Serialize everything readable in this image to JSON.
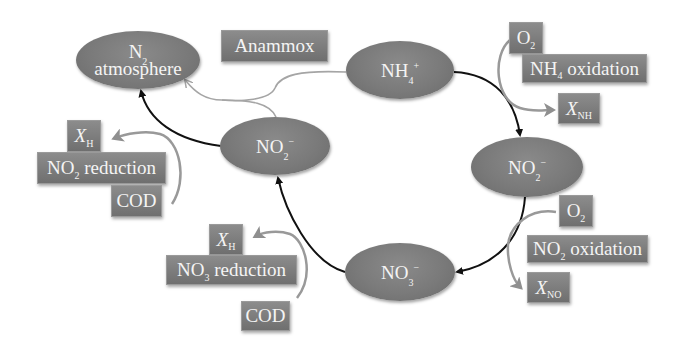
{
  "diagram": {
    "colors": {
      "node_fill": "#7a7a7a",
      "box_fill": "#7d7d7d",
      "text": "#f4f4f4",
      "main_arrow": "#111111",
      "side_arrow": "#9a9a9a"
    },
    "nodes": {
      "n2": {
        "line1_main": "N",
        "line1_sub": "2",
        "line2": "atmosphere"
      },
      "nh4": {
        "main": "NH",
        "sub": "4",
        "sup": "+"
      },
      "no2_right": {
        "main": "NO",
        "sub": "2",
        "sup": "−"
      },
      "no3": {
        "main": "NO",
        "sub": "3",
        "sup": "−"
      },
      "no2_left": {
        "main": "NO",
        "sub": "2",
        "sup": "−"
      }
    },
    "labels": {
      "anammox": "Anammox",
      "nh4_oxidation": {
        "pre": "NH",
        "sub": "4",
        "post": " oxidation"
      },
      "o2_top": {
        "main": "O",
        "sub": "2"
      },
      "xnh": {
        "main": "X",
        "sub": "NH"
      },
      "o2_mid": {
        "main": "O",
        "sub": "2"
      },
      "no2_oxidation": {
        "pre": "NO",
        "sub": "2",
        "post": " oxidation"
      },
      "xno": {
        "main": "X",
        "sub": "NO"
      },
      "xh_upper": {
        "main": "X",
        "sub": "H"
      },
      "no2_reduction": {
        "pre": "NO",
        "sub": "2",
        "post": " reduction"
      },
      "cod_upper": "COD",
      "xh_lower": {
        "main": "X",
        "sub": "H"
      },
      "no3_reduction": {
        "pre": "NO",
        "sub": "3",
        "post": " reduction"
      },
      "cod_lower": "COD"
    },
    "edges": [
      {
        "from": "NH4+",
        "to": "NO2- (right)",
        "type": "main"
      },
      {
        "from": "NO2- (right)",
        "to": "NO3-",
        "type": "main"
      },
      {
        "from": "NO3-",
        "to": "NO2- (left)",
        "type": "main"
      },
      {
        "from": "NO2- (left)",
        "to": "N2 atmosphere",
        "type": "main"
      },
      {
        "from": "NH4+ + NO2- (left)",
        "to": "N2 atmosphere",
        "type": "anammox"
      }
    ]
  }
}
